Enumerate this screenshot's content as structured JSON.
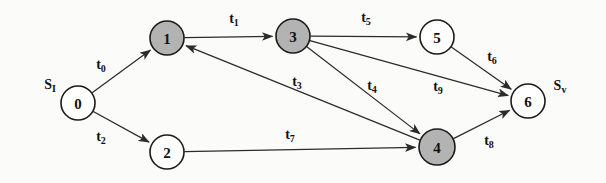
{
  "figure": {
    "name": "task-precedence-graph",
    "background_color": "#fbfbf9",
    "width": 606,
    "height": 183,
    "stroke_color": "#2b2b2b",
    "node_fill_shaded": "#b3b3b3",
    "node_fill_plain": "#ffffff",
    "node_stroke": "#1a1a1a"
  },
  "terminals": [
    {
      "id": "source",
      "base": "S",
      "sub": "I",
      "x": 50,
      "y": 84
    },
    {
      "id": "sink",
      "base": "S",
      "sub": "v",
      "x": 560,
      "y": 85
    }
  ],
  "nodes": [
    {
      "id": "n0",
      "label": "0",
      "x": 78,
      "y": 103,
      "r": 17,
      "shaded": false
    },
    {
      "id": "n1",
      "label": "1",
      "x": 167,
      "y": 38,
      "r": 17,
      "shaded": true
    },
    {
      "id": "n2",
      "label": "2",
      "x": 167,
      "y": 152,
      "r": 17,
      "shaded": false
    },
    {
      "id": "n3",
      "label": "3",
      "x": 293,
      "y": 36,
      "r": 17,
      "shaded": true
    },
    {
      "id": "n4",
      "label": "4",
      "x": 437,
      "y": 147,
      "r": 18,
      "shaded": true
    },
    {
      "id": "n5",
      "label": "5",
      "x": 437,
      "y": 37,
      "r": 17,
      "shaded": false
    },
    {
      "id": "n6",
      "label": "6",
      "x": 528,
      "y": 101,
      "r": 17,
      "shaded": false
    }
  ],
  "edges": [
    {
      "id": "e0",
      "base": "t",
      "sub": "0",
      "from": "n0",
      "to": "n1",
      "label_x": 101,
      "label_y": 64
    },
    {
      "id": "e1",
      "base": "t",
      "sub": "1",
      "from": "n1",
      "to": "n3",
      "label_x": 234,
      "label_y": 18
    },
    {
      "id": "e2",
      "base": "t",
      "sub": "2",
      "from": "n0",
      "to": "n2",
      "label_x": 101,
      "label_y": 136
    },
    {
      "id": "e3",
      "base": "t",
      "sub": "3",
      "from": "n4",
      "to": "n1",
      "label_x": 297,
      "label_y": 81
    },
    {
      "id": "e4",
      "base": "t",
      "sub": "4",
      "from": "n3",
      "to": "n4",
      "label_x": 372,
      "label_y": 85
    },
    {
      "id": "e5",
      "base": "t",
      "sub": "5",
      "from": "n3",
      "to": "n5",
      "label_x": 366,
      "label_y": 17
    },
    {
      "id": "e6",
      "base": "t",
      "sub": "6",
      "from": "n5",
      "to": "n6",
      "label_x": 492,
      "label_y": 56
    },
    {
      "id": "e7",
      "base": "t",
      "sub": "7",
      "from": "n2",
      "to": "n4",
      "label_x": 290,
      "label_y": 134
    },
    {
      "id": "e8",
      "base": "t",
      "sub": "8",
      "from": "n4",
      "to": "n6",
      "label_x": 489,
      "label_y": 140
    },
    {
      "id": "e9",
      "base": "t",
      "sub": "9",
      "from": "n3",
      "to": "n6",
      "label_x": 438,
      "label_y": 86
    }
  ]
}
